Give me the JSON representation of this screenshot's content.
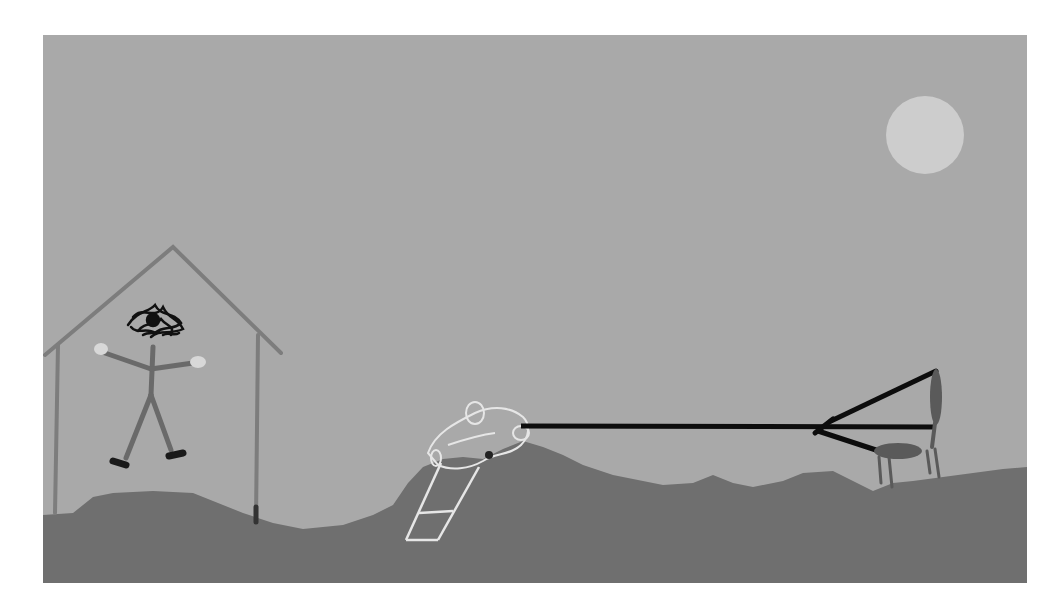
{
  "scene": {
    "title": "Drawing of a stick figure in a house, a car attached by a rope to a slingshot-like frame on a chair",
    "colors": {
      "page_bg": "#ffffff",
      "sky": "#a9a9a9",
      "ground": "#6f6f6f",
      "sun": "#cdcdcd",
      "house": "#7d7d7d",
      "figure": "#6a6a6a",
      "hair": "#111111",
      "hands": "#d8d8d8",
      "rope": "#0d0d0d",
      "car_outline": "#e6e6e6",
      "chair": "#5a5a5a"
    },
    "elements": [
      {
        "id": "sun",
        "label": "sun"
      },
      {
        "id": "house",
        "label": "house frame"
      },
      {
        "id": "stick-figure",
        "label": "stick figure with scribbled hair"
      },
      {
        "id": "car",
        "label": "outlined car with ladder"
      },
      {
        "id": "rope",
        "label": "black rope"
      },
      {
        "id": "slingshot",
        "label": "slingshot frame"
      },
      {
        "id": "chair",
        "label": "chair"
      },
      {
        "id": "ground",
        "label": "hilly ground"
      }
    ]
  }
}
